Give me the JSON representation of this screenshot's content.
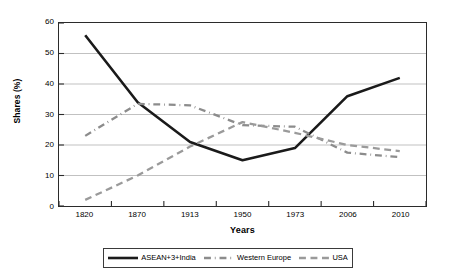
{
  "chart_data": {
    "type": "line",
    "title": "",
    "xlabel": "Years",
    "ylabel": "Shares (%)",
    "categories": [
      "1820",
      "1870",
      "1913",
      "1950",
      "1973",
      "2006",
      "2010"
    ],
    "ylim": [
      0,
      60
    ],
    "yticks": [
      "60",
      "50",
      "40",
      "30",
      "20",
      "10",
      "0"
    ],
    "ytick_values": [
      60,
      50,
      40,
      30,
      20,
      10,
      0
    ],
    "grid": "horizontal",
    "legend_position": "bottom",
    "series": [
      {
        "name": "ASEAN+3+India",
        "style": "solid",
        "color": "#1a1a1a",
        "values": [
          56,
          34,
          21,
          15,
          19,
          36,
          42
        ]
      },
      {
        "name": "Western Europe",
        "style": "dash-dot",
        "color": "#8c8c8c",
        "values": [
          23,
          33.5,
          33,
          26.5,
          26,
          17.5,
          16
        ]
      },
      {
        "name": "USA",
        "style": "dashed",
        "color": "#9a9a9a",
        "values": [
          2,
          10,
          19.5,
          27.5,
          24,
          20,
          18
        ]
      }
    ]
  },
  "legend": {
    "items": [
      {
        "label": "ASEAN+3+India",
        "style": "solid",
        "color": "#1a1a1a"
      },
      {
        "label": "Western Europe",
        "style": "dash-dot",
        "color": "#8c8c8c"
      },
      {
        "label": "USA",
        "style": "dashed",
        "color": "#9a9a9a"
      }
    ]
  }
}
